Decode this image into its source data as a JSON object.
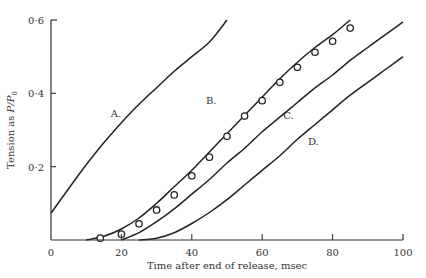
{
  "chart_data": {
    "type": "line",
    "title": "",
    "xlabel": "Time after end of release, msec",
    "ylabel": "Tension as P/P₀",
    "xlim": [
      0,
      100
    ],
    "ylim": [
      0,
      0.6
    ],
    "grid": false,
    "legend": "none (curves labelled inline)",
    "x_ticks": [
      0,
      20,
      40,
      60,
      80,
      100
    ],
    "x_tick_labels": [
      "0",
      "20",
      "40",
      "60",
      "80",
      "100"
    ],
    "y_ticks": [
      0.2,
      0.4,
      0.6
    ],
    "y_tick_labels": [
      "0·2",
      "0·4",
      "0·6"
    ],
    "series": [
      {
        "name": "A.",
        "kind": "line",
        "x": [
          0,
          5,
          10,
          15,
          20,
          25,
          30,
          35,
          40,
          45,
          50
        ],
        "y": [
          0.073,
          0.14,
          0.205,
          0.265,
          0.32,
          0.37,
          0.415,
          0.46,
          0.5,
          0.54,
          0.6
        ]
      },
      {
        "name": "B.",
        "kind": "line",
        "x": [
          10,
          15,
          20,
          25,
          30,
          35,
          40,
          45,
          50,
          55,
          60,
          65,
          70,
          75,
          80,
          85
        ],
        "y": [
          0.0,
          0.01,
          0.03,
          0.06,
          0.1,
          0.145,
          0.19,
          0.24,
          0.29,
          0.34,
          0.39,
          0.44,
          0.485,
          0.525,
          0.56,
          0.6
        ]
      },
      {
        "name": "C.",
        "kind": "line",
        "x": [
          20,
          25,
          30,
          35,
          40,
          45,
          50,
          55,
          60,
          65,
          70,
          75,
          80,
          85,
          90,
          95,
          100
        ],
        "y": [
          0.0,
          0.02,
          0.05,
          0.085,
          0.125,
          0.165,
          0.21,
          0.25,
          0.295,
          0.335,
          0.375,
          0.415,
          0.45,
          0.49,
          0.525,
          0.56,
          0.595
        ]
      },
      {
        "name": "D.",
        "kind": "line",
        "x": [
          25,
          30,
          35,
          40,
          45,
          50,
          55,
          60,
          65,
          70,
          75,
          80,
          85,
          90,
          95,
          100
        ],
        "y": [
          0.0,
          0.005,
          0.02,
          0.045,
          0.075,
          0.11,
          0.15,
          0.19,
          0.23,
          0.275,
          0.315,
          0.355,
          0.395,
          0.43,
          0.465,
          0.5
        ]
      },
      {
        "name": "observed",
        "kind": "scatter",
        "marker": "open-circle",
        "x": [
          14,
          20,
          25,
          30,
          35,
          40,
          45,
          50,
          55,
          60,
          65,
          70,
          75,
          80,
          85
        ],
        "y": [
          0.005,
          0.016,
          0.044,
          0.082,
          0.123,
          0.175,
          0.226,
          0.283,
          0.338,
          0.38,
          0.43,
          0.471,
          0.512,
          0.542,
          0.578
        ]
      }
    ],
    "annotations": [
      {
        "text": "A.",
        "x": 17,
        "y": 0.335
      },
      {
        "text": "B.",
        "x": 44,
        "y": 0.37
      },
      {
        "text": "C.",
        "x": 66,
        "y": 0.33
      },
      {
        "text": "D.",
        "x": 73,
        "y": 0.26
      }
    ]
  },
  "axes": {
    "x_title": "Time after end of release, msec",
    "y_title_prefix": "Tension as ",
    "y_title_var": "P/P",
    "y_title_sub": "0",
    "origin_label": "0"
  },
  "colors": {
    "ink": "#222222",
    "background": "#ffffff"
  }
}
